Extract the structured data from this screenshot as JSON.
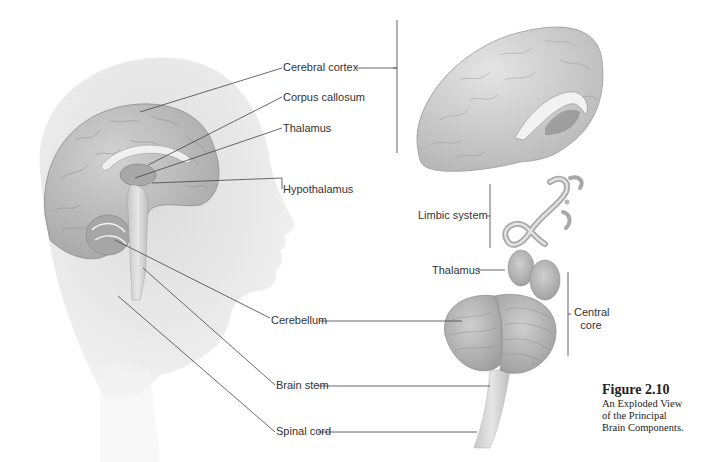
{
  "figure": {
    "number": "Figure 2.10",
    "caption_lines": [
      "An Exploded View",
      "of the Principal",
      "Brain Components."
    ]
  },
  "labels": {
    "cerebral_cortex": "Cerebral cortex",
    "corpus_callosum": "Corpus callosum",
    "thalamus_left": "Thalamus",
    "hypothalamus": "Hypothalamus",
    "limbic_system": "Limbic system",
    "thalamus_right": "Thalamus",
    "central_core_line1": "Central",
    "central_core_line2": "core",
    "cerebellum": "Cerebellum",
    "brain_stem": "Brain stem",
    "spinal_cord": "Spinal cord"
  },
  "colors": {
    "background": "#ffffff",
    "head_silhouette": "#e6e6e6",
    "brain_tissue": "#b8b8b8",
    "leader_line": "#444444",
    "label_text": "#333333"
  }
}
